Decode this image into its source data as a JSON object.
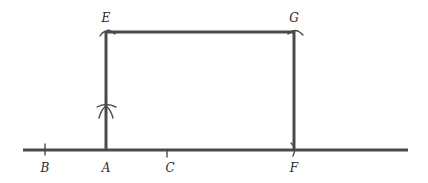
{
  "diagram": {
    "colors": {
      "stroke": "#4a4a4a",
      "label": "#2a2a2a",
      "background": "#ffffff"
    },
    "points": [
      {
        "id": "E",
        "label": "E",
        "x": 106,
        "y": 32,
        "label_x": 106,
        "label_y": 22
      },
      {
        "id": "G",
        "label": "G",
        "x": 294,
        "y": 32,
        "label_x": 294,
        "label_y": 22
      },
      {
        "id": "B",
        "label": "B",
        "x": 45,
        "y": 150,
        "label_x": 45,
        "label_y": 172
      },
      {
        "id": "A",
        "label": "A",
        "x": 106,
        "y": 150,
        "label_x": 106,
        "label_y": 172
      },
      {
        "id": "C",
        "label": "C",
        "x": 167,
        "y": 150,
        "label_x": 170,
        "label_y": 172
      },
      {
        "id": "F",
        "label": "F",
        "x": 294,
        "y": 150,
        "label_x": 294,
        "label_y": 172
      }
    ],
    "segments": [
      {
        "name": "baseline",
        "from": [
          23,
          150
        ],
        "to": [
          408,
          150
        ]
      },
      {
        "name": "segment-AE",
        "from": [
          106,
          150
        ],
        "to": [
          106,
          32
        ]
      },
      {
        "name": "segment-EG",
        "from": [
          106,
          32
        ],
        "to": [
          294,
          32
        ]
      },
      {
        "name": "segment-GF",
        "from": [
          294,
          32
        ],
        "to": [
          294,
          150
        ]
      }
    ],
    "ticks": [
      {
        "name": "tick-B",
        "x": 45
      },
      {
        "name": "tick-C",
        "x": 167
      }
    ],
    "arc_marks": [
      {
        "name": "arc-intersection-mark",
        "x": 106,
        "y": 108
      }
    ]
  }
}
